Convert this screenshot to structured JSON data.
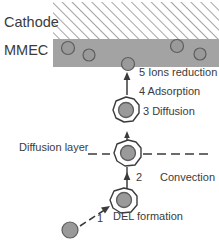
{
  "figure": {
    "region_labels": {
      "cathode": "Cathode",
      "mmec": "MMEC",
      "diffusion_layer": "Diffusion layer"
    },
    "steps": [
      {
        "number": "1",
        "label": "DEL formation",
        "text": "1  DEL formation"
      },
      {
        "number": "2",
        "label": "Convection",
        "text": "2  Convection"
      },
      {
        "number": "3",
        "label": "Diffusion",
        "text": "3 Diffusion"
      },
      {
        "number": "4",
        "label": "Adsorption",
        "text": "4 Adsorption"
      },
      {
        "number": "5",
        "label": "Ions reduction",
        "text": "5 Ions reduction"
      }
    ],
    "step_text": {
      "s5": "5 Ions reduction",
      "s4": "4 Adsorption",
      "s3": "3 Diffusion",
      "s2_number": "2",
      "s2_name": "Convection",
      "s1_number": "1",
      "s1_name": "DEL formation"
    },
    "colors": {
      "band_fill": "#a3a3a3",
      "particle_fill": "#9a9a9a",
      "particle_stroke": "#5d5d5d",
      "hatch_stroke": "#8d8d8d",
      "ink": "#3b3b3b",
      "background": "#ffffff"
    },
    "particles_in_band": [
      {
        "cx": 68,
        "cy": 48,
        "r": 6.5
      },
      {
        "cx": 89,
        "cy": 55,
        "r": 6.0
      },
      {
        "cx": 128,
        "cy": 64,
        "r": 6.5
      },
      {
        "cx": 177,
        "cy": 46,
        "r": 6.5
      },
      {
        "cx": 200,
        "cy": 54,
        "r": 6.0
      }
    ],
    "free_particle": {
      "cx": 70,
      "cy": 230,
      "r": 8
    }
  }
}
